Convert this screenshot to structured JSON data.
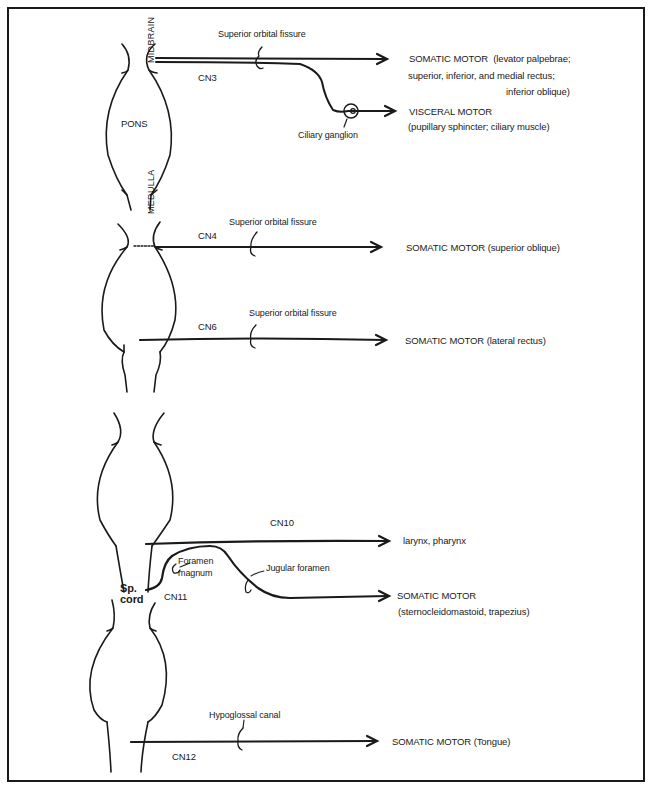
{
  "figure": {
    "structures": {
      "midbrain": "MIDBRAIN",
      "pons": "PONS",
      "medulla": "MEDULLA",
      "spinal_cord": "Sp.\ncord",
      "spinal_cord_line1": "Sp.",
      "spinal_cord_line2": "cord"
    },
    "panels": [
      {
        "nerve": "CN3",
        "foramen": "Superior orbital fissure",
        "ganglion": "Ciliary ganglion",
        "targets": [
          {
            "type": "SOMATIC MOTOR",
            "detail_line1": "(levator palpebrae;",
            "detail_line2": "superior, inferior, and medial rectus;",
            "detail_line3": "inferior oblique)"
          },
          {
            "type": "VISCERAL MOTOR",
            "detail_line1": "(pupillary sphincter; ciliary muscle)"
          }
        ]
      },
      {
        "nerve": "CN4",
        "foramen": "Superior orbital fissure",
        "target": "SOMATIC MOTOR (superior oblique)"
      },
      {
        "nerve": "CN6",
        "foramen": "Superior orbital fissure",
        "target": "SOMATIC MOTOR (lateral rectus)"
      },
      {
        "nerve": "CN10",
        "target": "larynx, pharynx"
      },
      {
        "nerve": "CN11",
        "foramen_1_line1": "Foramen",
        "foramen_1_line2": "magnum",
        "foramen_2": "Jugular foramen",
        "target_type": "SOMATIC MOTOR",
        "target_detail": "(sternocleidomastoid, trapezius)"
      },
      {
        "nerve": "CN12",
        "foramen": "Hypoglossal canal",
        "target": "SOMATIC MOTOR (Tongue)"
      }
    ],
    "colors": {
      "ink": "#1a1a1a",
      "paper": "#ffffff"
    }
  }
}
